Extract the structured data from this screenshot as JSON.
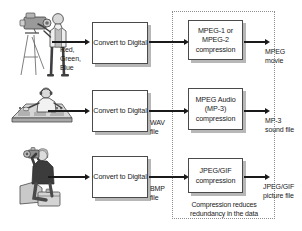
{
  "diagram": {
    "group_caption": "Compression reduces\nredundancy in the data",
    "rows": [
      {
        "id": "video",
        "source_icon": "video-camera-operator-illustration",
        "source_label": "Red,\nGreen,\nBlue",
        "convert_label": "Convert\nto Digital",
        "intermediate_label": "",
        "compression_label": "MPEG-1\nor MPEG-2\ncompression",
        "output_label": "MPEG\nmovie"
      },
      {
        "id": "audio",
        "source_icon": "audio-engineer-mixing-console-illustration",
        "source_label": "",
        "convert_label": "Convert\nto Digital",
        "intermediate_label": "WAV\nfile",
        "compression_label": "MPEG Audio\n(MP-3)\ncompression",
        "output_label": "MP-3\nsound file"
      },
      {
        "id": "image",
        "source_icon": "photographer-illustration",
        "source_label": "",
        "convert_label": "Convert\nto Digital",
        "intermediate_label": "BMP\nfile",
        "compression_label": "JPEG/GIF\ncompression",
        "output_label": "JPEG/GIF\npicture file"
      }
    ],
    "colors": {
      "background": "#ffffff",
      "box_border": "#4a4a4a",
      "box_shadow": "#b7b7b7",
      "dotted_border": "#8d8d8d",
      "arrow": "#1a1a1a",
      "text": "#1a1a1a"
    }
  }
}
